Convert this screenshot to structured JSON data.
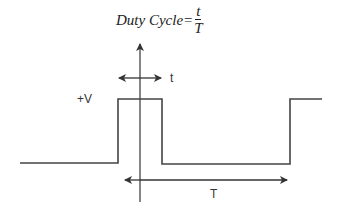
{
  "formula": {
    "lhs": "Duty Cycle=",
    "numerator": "t",
    "denominator": "T"
  },
  "labels": {
    "voltage": "+V",
    "pulse_width": "t",
    "period": "T"
  },
  "colors": {
    "line": "#444444",
    "text": "#333333"
  }
}
